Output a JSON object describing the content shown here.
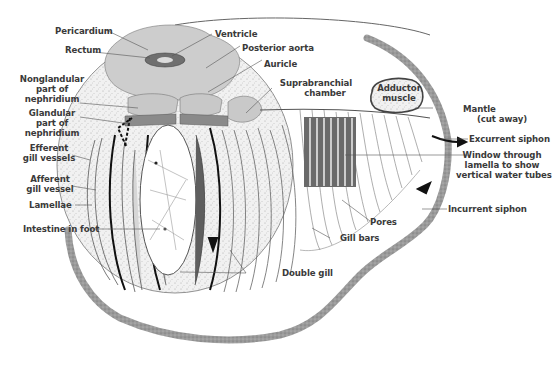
{
  "figure": {
    "colors": {
      "background": "#ffffff",
      "outline_stipple": "#8e8e8e",
      "tissue_gray": "#c9c9c9",
      "dark_gray": "#6e6e6e",
      "stipple_light": "#ececec",
      "label_text": "#3a3a3a",
      "leader_line": "#555555",
      "flow_arrow": "#111111"
    },
    "labels": {
      "pericardium": "Pericardium",
      "rectum": "Rectum",
      "ventricle": "Ventricle",
      "posterior_aorta": "Posterior aorta",
      "auricle": "Auricle",
      "nonglandular_1": "Nonglandular",
      "nonglandular_2": "part of",
      "nonglandular_3": "nephridium",
      "glandular_1": "Glandular",
      "glandular_2": "part of",
      "glandular_3": "nephridium",
      "suprabranchial_1": "Suprabranchial",
      "suprabranchial_2": "chamber",
      "adductor_1": "Adductor",
      "adductor_2": "muscle",
      "mantle_1": "Mantle",
      "mantle_2": "(cut away)",
      "excurrent_siphon": "Excurrent siphon",
      "window_1": "Window through",
      "window_2": "lamella  to show",
      "window_3": "vertical water tubes",
      "efferent_1": "Efferent",
      "efferent_2": "gill vessels",
      "afferent_1": "Afferent",
      "afferent_2": "gill vessel",
      "lamellae": "Lamellae",
      "intestine_in_foot": "Intestine in foot",
      "incurrent_siphon": "Incurrent siphon",
      "pores": "Pores",
      "gill_bars": "Gill bars",
      "double_gill": "Double gill"
    }
  }
}
